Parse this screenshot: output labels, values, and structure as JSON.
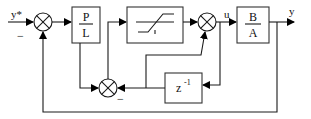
{
  "diagram": {
    "type": "control-loop-block-diagram",
    "signals": {
      "reference": "y*",
      "control": "u",
      "output": "y",
      "minus_sign_1": "−",
      "minus_sign_2": "−"
    },
    "blocks": {
      "controller": {
        "numerator": "P",
        "denominator": "L"
      },
      "saturation": {
        "label": "saturation"
      },
      "plant": {
        "numerator": "B",
        "denominator": "A"
      },
      "delay": {
        "base": "z",
        "exponent": "-1"
      }
    },
    "summing_junctions": [
      "sum-reference-error",
      "sum-saturation-output",
      "sum-antiwindup"
    ],
    "colors": {
      "line": "#1a1a1a",
      "background": "#ffffff"
    }
  }
}
